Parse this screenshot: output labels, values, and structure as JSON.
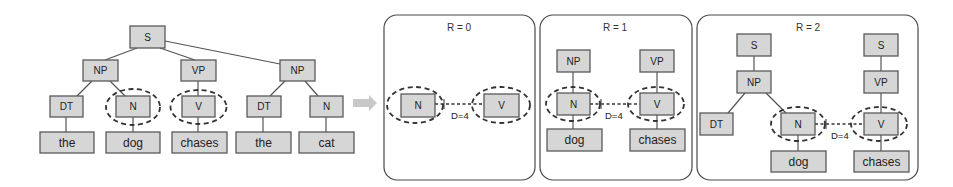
{
  "figure": {
    "arrow_color": "#c8c8c8",
    "box_fill": "#d6d6d6",
    "box_stroke": "#5a5a5a"
  },
  "full_tree": {
    "nodes": {
      "S": "S",
      "NP1": "NP",
      "VP": "VP",
      "NP2": "NP",
      "DT1": "DT",
      "N1": "N",
      "V": "V",
      "DT2": "DT",
      "N2": "N",
      "w1": "the",
      "w2": "dog",
      "w3": "chases",
      "w4": "the",
      "w5": "cat"
    },
    "highlighted": [
      "N",
      "V"
    ]
  },
  "panels": [
    {
      "title": "R = 0",
      "distance_label": "D=4",
      "nodes": {
        "N": "N",
        "V": "V"
      }
    },
    {
      "title": "R = 1",
      "distance_label": "D=4",
      "nodes": {
        "NP": "NP",
        "VP": "VP",
        "N": "N",
        "V": "V",
        "dog": "dog",
        "chases": "chases"
      }
    },
    {
      "title": "R = 2",
      "distance_label": "D=4",
      "nodes": {
        "S1": "S",
        "NP": "NP",
        "DT": "DT",
        "N": "N",
        "dog": "dog",
        "S2": "S",
        "VP": "VP",
        "V": "V",
        "chases": "chases"
      }
    }
  ]
}
